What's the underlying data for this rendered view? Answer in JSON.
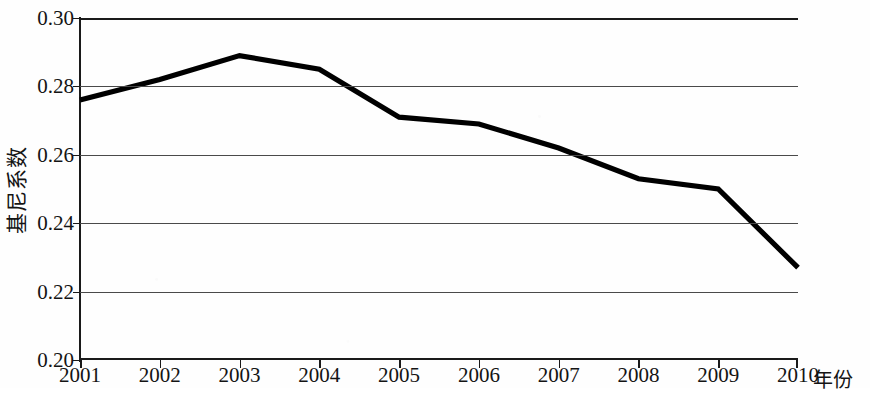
{
  "chart_data": {
    "type": "line",
    "title": "",
    "subtitle": "",
    "xlabel": "年份",
    "ylabel": "基尼系数",
    "x": [
      2001,
      2002,
      2003,
      2004,
      2005,
      2006,
      2007,
      2008,
      2009,
      2010
    ],
    "categories": [
      "2001",
      "2002",
      "2003",
      "2004",
      "2005",
      "2006",
      "2007",
      "2008",
      "2009",
      "2010"
    ],
    "values": [
      0.276,
      0.282,
      0.289,
      0.285,
      0.271,
      0.269,
      0.262,
      0.253,
      0.25,
      0.227
    ],
    "series": [
      {
        "name": "基尼系数",
        "values": [
          0.276,
          0.282,
          0.289,
          0.285,
          0.271,
          0.269,
          0.262,
          0.253,
          0.25,
          0.227
        ]
      }
    ],
    "ylim": [
      0.2,
      0.3
    ],
    "xlim": [
      2001,
      2010
    ],
    "ytick_labels": [
      "0.30",
      "0.28",
      "0.26",
      "0.24",
      "0.22",
      "0.20"
    ],
    "ytick_values": [
      0.3,
      0.28,
      0.26,
      0.24,
      0.22,
      0.2
    ],
    "xtick_labels": [
      "2001",
      "2002",
      "2003",
      "2004",
      "2005",
      "2006",
      "2007",
      "2008",
      "2009",
      "2010"
    ],
    "grid": true,
    "grid_axis": "y",
    "legend": false,
    "legend_position": "none",
    "annotations": [],
    "line_color": "#000000",
    "grid_color": "#4a4a4a",
    "axis_color": "#1a1a1a",
    "background_color": "#fefefe"
  },
  "figure": {
    "y_axis_title": "基尼系数",
    "x_axis_title": "年份"
  }
}
